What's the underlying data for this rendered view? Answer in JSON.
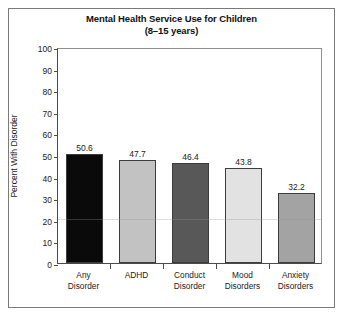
{
  "figure": {
    "title_line1": "Mental Health Service Use for Children",
    "title_line2": "(8–15 years)"
  },
  "chart_data": {
    "type": "bar",
    "title": "Mental Health Service Use for Children (8–15 years)",
    "xlabel": "",
    "ylabel": "Percent With Disorder",
    "categories": [
      "Any Disorder",
      "ADHD",
      "Conduct Disorder",
      "Mood Disorders",
      "Anxiety Disorders"
    ],
    "category_lines": [
      [
        "Any",
        "Disorder"
      ],
      [
        "ADHD",
        ""
      ],
      [
        "Conduct",
        "Disorder"
      ],
      [
        "Mood",
        "Disorders"
      ],
      [
        "Anxiety",
        "Disorders"
      ]
    ],
    "values": [
      50.6,
      47.7,
      46.4,
      43.8,
      32.2
    ],
    "value_labels": [
      "50.6",
      "47.7",
      "46.4",
      "43.8",
      "32.2"
    ],
    "bar_colors": [
      "#0a0a0a",
      "#c2c2c2",
      "#585858",
      "#e2e2e2",
      "#a3a3a3"
    ],
    "ylim": [
      0,
      100
    ],
    "yticks": [
      0,
      10,
      20,
      30,
      40,
      50,
      60,
      70,
      80,
      90,
      100
    ],
    "ytick_labels": [
      "0",
      "10",
      "20",
      "30",
      "40",
      "50",
      "60",
      "70",
      "80",
      "90",
      "100"
    ],
    "grid": false,
    "legend": "none"
  }
}
